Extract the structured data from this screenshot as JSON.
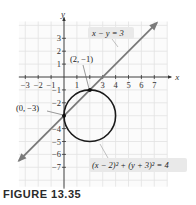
{
  "caption": "FIGURE 13.35",
  "chart_data": {
    "type": "line",
    "title": "",
    "xlabel": "x",
    "ylabel": "y",
    "xlim": [
      -3.5,
      8
    ],
    "ylim": [
      -8.5,
      4.3
    ],
    "grid": true,
    "x_ticks": [
      -3,
      -2,
      -1,
      1,
      2,
      3,
      4,
      5,
      6,
      7
    ],
    "x_tick_labels": [
      "−3",
      "−2",
      "−1",
      "1",
      "",
      "3",
      "4",
      "5",
      "6",
      "7"
    ],
    "y_ticks": [
      3,
      2,
      1,
      -1,
      -2,
      -3,
      -4,
      -5,
      -6,
      -7
    ],
    "y_tick_labels": [
      "3",
      "2",
      "1",
      "−1",
      "−2",
      "",
      "−4",
      "−5",
      "−6",
      "−7"
    ],
    "series": [
      {
        "name": "x − y = 3",
        "kind": "line",
        "equation": "y = x - 3",
        "x": [
          -3.5,
          7.2
        ],
        "y": [
          -6.5,
          4.2
        ],
        "color": "#7a7a7a",
        "arrows": "both"
      },
      {
        "name": "(x − 2)² + (y + 3)² = 4",
        "kind": "circle",
        "center": [
          2,
          -3
        ],
        "radius": 2,
        "color": "#1a1a1a"
      }
    ],
    "points": [
      {
        "x": 2,
        "y": -1,
        "label": "(2, −1)"
      },
      {
        "x": 0,
        "y": -3,
        "label": "(0, −3)"
      }
    ],
    "annotations": [
      {
        "text": "x − y = 3",
        "target": "line"
      },
      {
        "text": "(x − 2)² + (y + 3)² = 4",
        "target": "circle"
      }
    ]
  }
}
